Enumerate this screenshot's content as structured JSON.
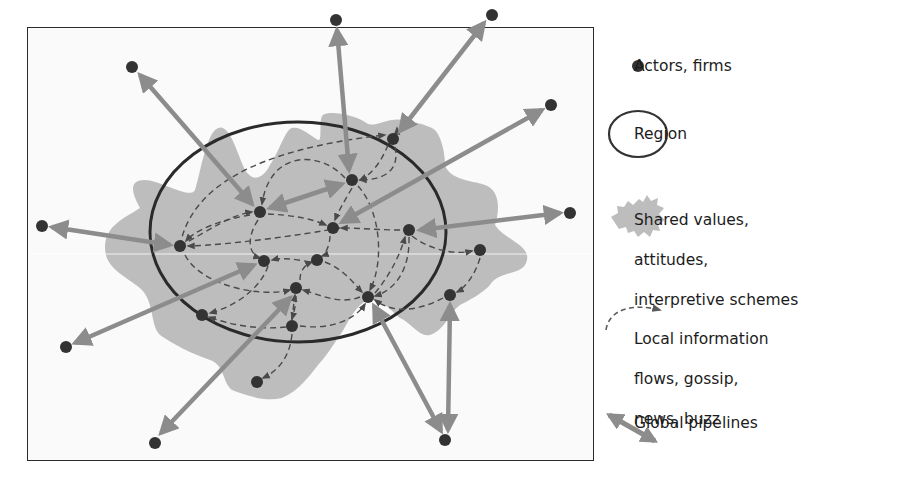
{
  "legend": {
    "items": [
      {
        "key": "actors",
        "icon": "dot-icon",
        "label": "Actors, firms"
      },
      {
        "key": "region",
        "icon": "ellipse-icon",
        "label": "Region"
      },
      {
        "key": "shared",
        "icon": "blob-icon",
        "lines": [
          "Shared values,",
          "attitudes,",
          "interpretive schemes"
        ]
      },
      {
        "key": "local",
        "icon": "dashed-curved-arrow-icon",
        "lines": [
          "Local information",
          "flows, gossip,",
          "news, buzz"
        ]
      },
      {
        "key": "global",
        "icon": "double-arrow-icon",
        "label": "Global pipelines"
      }
    ]
  },
  "colors": {
    "node": "#333333",
    "region_outline": "#2a2a2a",
    "shared_fill": "#bdbdbd",
    "pipeline": "#8c8c8c",
    "local_flow": "#4a4a4a",
    "background": "#fafafa"
  },
  "diagram": {
    "region": {
      "cx": 298,
      "cy": 232,
      "rx": 148,
      "ry": 110
    },
    "inner_nodes": [
      {
        "id": "n1",
        "x": 180,
        "y": 246
      },
      {
        "id": "n2",
        "x": 260,
        "y": 212
      },
      {
        "id": "n3",
        "x": 352,
        "y": 180
      },
      {
        "id": "n4",
        "x": 393,
        "y": 139
      },
      {
        "id": "n5",
        "x": 333,
        "y": 228
      },
      {
        "id": "n6",
        "x": 409,
        "y": 230
      },
      {
        "id": "n7",
        "x": 264,
        "y": 261
      },
      {
        "id": "n8",
        "x": 317,
        "y": 260
      },
      {
        "id": "n9",
        "x": 296,
        "y": 288
      },
      {
        "id": "n10",
        "x": 368,
        "y": 297
      },
      {
        "id": "n11",
        "x": 202,
        "y": 315
      },
      {
        "id": "n12",
        "x": 292,
        "y": 326
      },
      {
        "id": "n13",
        "x": 480,
        "y": 250
      },
      {
        "id": "n14",
        "x": 450,
        "y": 295
      },
      {
        "id": "n15",
        "x": 257,
        "y": 382
      }
    ],
    "outer_nodes": [
      {
        "id": "o1",
        "x": 132,
        "y": 67
      },
      {
        "id": "o2",
        "x": 336,
        "y": 20
      },
      {
        "id": "o3",
        "x": 492,
        "y": 15
      },
      {
        "id": "o4",
        "x": 551,
        "y": 105
      },
      {
        "id": "o5",
        "x": 42,
        "y": 226
      },
      {
        "id": "o6",
        "x": 570,
        "y": 213
      },
      {
        "id": "o7",
        "x": 66,
        "y": 347
      },
      {
        "id": "o8",
        "x": 155,
        "y": 443
      },
      {
        "id": "o9",
        "x": 445,
        "y": 440
      }
    ],
    "pipelines": [
      [
        "o1",
        "n2"
      ],
      [
        "o2",
        "n3"
      ],
      [
        "o3",
        "n4"
      ],
      [
        "o4",
        "n5"
      ],
      [
        "o5",
        "n1"
      ],
      [
        "o6",
        "n6"
      ],
      [
        "o7",
        "n7"
      ],
      [
        "o8",
        "n9"
      ],
      [
        "o9",
        "n10"
      ],
      [
        "o9",
        "n14"
      ],
      [
        "n2",
        "n3"
      ]
    ]
  }
}
